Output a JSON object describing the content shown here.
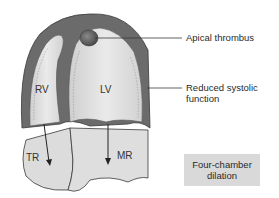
{
  "diagram": {
    "chambers": [
      {
        "id": "rv",
        "label": "RV"
      },
      {
        "id": "lv",
        "label": "LV"
      },
      {
        "id": "tr",
        "label": "TR"
      },
      {
        "id": "mr",
        "label": "MR"
      }
    ],
    "callouts": [
      {
        "id": "apical-thrombus",
        "text": "Apical thrombus"
      },
      {
        "id": "reduced-systolic",
        "line1": "Reduced systolic",
        "line2": "function"
      }
    ],
    "box": {
      "line1": "Four-chamber",
      "line2": "dilation"
    },
    "colors": {
      "wall": "#6b6b6b",
      "cavity": "#e2e2e2",
      "atria": "#dcdcdc",
      "thrombus": "#5a5a5a",
      "box": "#d9d9d9",
      "outline": "#3a3a3a"
    }
  }
}
